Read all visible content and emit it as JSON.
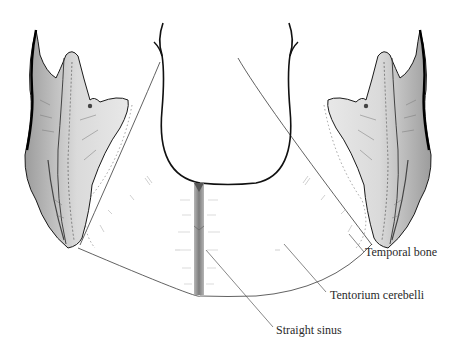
{
  "figure": {
    "labels": [
      {
        "id": "temporal_bone",
        "text": "Temporal bone",
        "x": 365,
        "y": 252
      },
      {
        "id": "tentorium_cerebelli",
        "text": "Tentorium cerebelli",
        "x": 330,
        "y": 294
      },
      {
        "id": "straight_sinus",
        "text": "Straight sinus",
        "x": 276,
        "y": 330
      }
    ],
    "colors": {
      "ink": "#1a1a1a",
      "bone_fill": "#d6d6d6",
      "bone_shade": "#8a8a8a",
      "sinus": "#9a9a9a",
      "leader": "#555555"
    }
  }
}
